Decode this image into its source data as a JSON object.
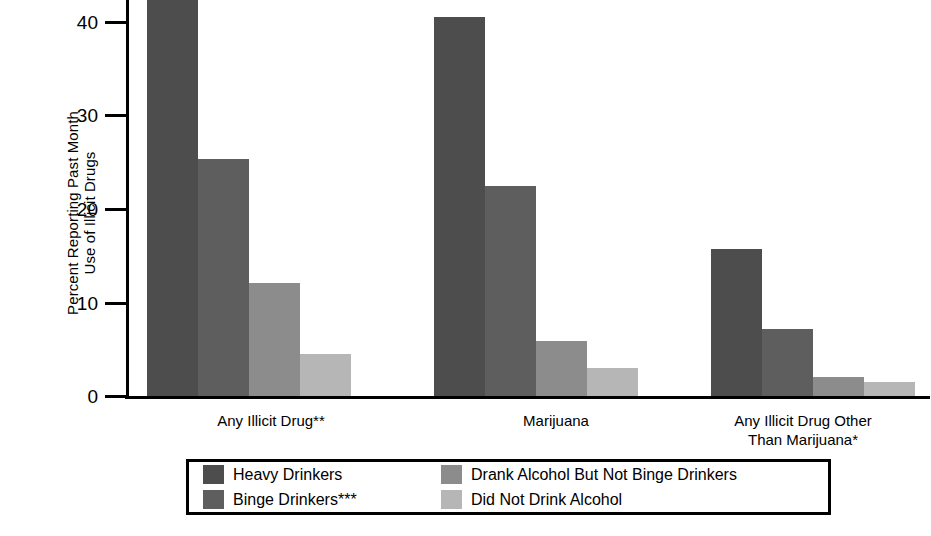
{
  "chart_data": {
    "type": "bar",
    "title": "",
    "subtitle": "",
    "xlabel": "",
    "ylabel": "Percent Reporting Past Month Use of Illicit Drugs",
    "ylabel_lines": [
      "Percent Reporting Past Month",
      "Use of Illicit Drugs"
    ],
    "categories": [
      "Any Illicit Drug**",
      "Marijuana",
      "Any Illicit Drug Other\nThan Marijuana*"
    ],
    "series": [
      {
        "name": "Heavy Drinkers",
        "color": "#4d4d4d",
        "values": [
          42.4,
          40.4,
          15.7
        ]
      },
      {
        "name": "Binge Drinkers***",
        "color": "#5e5e5e",
        "values": [
          25.3,
          22.4,
          7.1
        ]
      },
      {
        "name": "Drank Alcohol But Not Binge Drinkers",
        "color": "#8c8c8c",
        "values": [
          12.1,
          5.9,
          2.0
        ]
      },
      {
        "name": "Did Not Drink Alcohol",
        "color": "#b6b6b6",
        "values": [
          4.5,
          3.0,
          1.5
        ]
      }
    ],
    "yticks": [
      0,
      10,
      20,
      30,
      40
    ],
    "ytick_labels": [
      "0",
      "10",
      "20",
      "30",
      "40"
    ],
    "ylim": [
      0,
      42.6
    ],
    "grid": false,
    "legend_position": "bottom"
  },
  "legend": {
    "items": [
      {
        "label": "Heavy Drinkers",
        "color": "#4d4d4d"
      },
      {
        "label": "Binge Drinkers***",
        "color": "#5e5e5e"
      },
      {
        "label": "Drank Alcohol But Not Binge Drinkers",
        "color": "#8c8c8c"
      },
      {
        "label": "Did Not Drink Alcohol",
        "color": "#b6b6b6"
      }
    ]
  },
  "axis": {
    "tick_40": "40",
    "tick_30": "30",
    "tick_20": "20",
    "tick_10": "10",
    "tick_0": "0"
  },
  "categories_display": {
    "c0": "Any Illicit Drug**",
    "c1": "Marijuana",
    "c2": "Any Illicit Drug Other\nThan Marijuana*"
  },
  "ylabel_parts": {
    "line1": "Percent Reporting Past Month",
    "line2": "Use of Illicit Drugs"
  }
}
